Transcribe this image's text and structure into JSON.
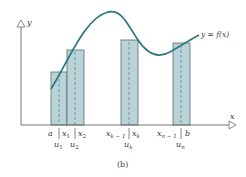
{
  "figure": {
    "caption": "(b)",
    "colors": {
      "axis": "#6a6a6a",
      "curve": "#2e7a7e",
      "rect_fill": "#b8d4d8",
      "rect_stroke": "#5e6a6c",
      "dash": "#7a8c8e",
      "text": "#3a3a3a"
    },
    "axes": {
      "x_label": "x",
      "y_label": "y"
    },
    "curve_label": "y = f(x)",
    "rectangles": [
      {
        "name": "rect-1",
        "left_label": "a",
        "right_label": "x1",
        "sample_label": "u1"
      },
      {
        "name": "rect-2",
        "left_label": "x1",
        "right_label": "x2",
        "sample_label": "u2"
      },
      {
        "name": "rect-k",
        "left_label": "xk−1",
        "right_label": "xk",
        "sample_label": "uk"
      },
      {
        "name": "rect-n",
        "left_label": "xn−1",
        "right_label": "b",
        "sample_label": "un"
      }
    ],
    "tick_labels": {
      "a": "a",
      "x1": "x",
      "x1_sub": "1",
      "x2": "x",
      "x2_sub": "2",
      "xk1": "x",
      "xk1_sub": "k − 1",
      "xk": "x",
      "xk_sub": "k",
      "xn1": "x",
      "xn1_sub": "n − 1",
      "b": "b",
      "u1": "u",
      "u1_sub": "1",
      "u2": "u",
      "u2_sub": "2",
      "uk": "u",
      "uk_sub": "k",
      "un": "u",
      "un_sub": "n"
    }
  }
}
